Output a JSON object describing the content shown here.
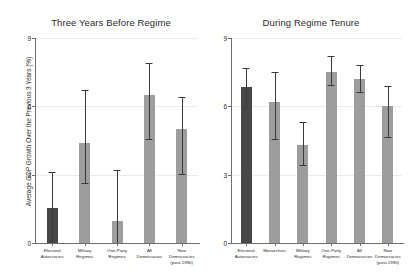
{
  "figure": {
    "ylabel": "Average GDP Growth Over the Previous 3 Years (%)",
    "bar_color": "#9d9d9d",
    "highlight_color": "#474747",
    "axis_color": "#6f6f6f",
    "grid_color": "#ebebeb"
  },
  "chart_data": [
    {
      "type": "bar",
      "title": "Three Years Before Regime",
      "xlabel": "",
      "ylabel": "Average GDP Growth Over the Previous 3 Years (%)",
      "ylim": [
        0,
        9
      ],
      "yticks": [
        0,
        3,
        6,
        9
      ],
      "ytick_labels": [
        "0",
        "3",
        "6",
        "9"
      ],
      "grid": true,
      "legend": "none",
      "categories": [
        "Electoral\nAutocracies",
        "Military\nRegimes",
        "One-Party\nRegimes",
        "All\nDemocracies",
        "New\nDemocracies\n(post-1990)"
      ],
      "values": [
        1.55,
        4.4,
        0.95,
        6.5,
        5.0
      ],
      "ci_low": [
        0.0,
        2.6,
        0.0,
        4.5,
        3.0
      ],
      "ci_high": [
        3.1,
        6.7,
        3.2,
        7.9,
        6.4
      ],
      "highlighted_index": 0
    },
    {
      "type": "bar",
      "title": "During Regime Tenure",
      "xlabel": "",
      "ylabel": "",
      "ylim": [
        0,
        9
      ],
      "yticks": [
        0,
        3,
        6,
        9
      ],
      "ytick_labels": [
        "0",
        "3",
        "6",
        "9"
      ],
      "grid": true,
      "legend": "none",
      "categories": [
        "Electoral\nAutocracies",
        "Monarchies",
        "Military\nRegimes",
        "One-Party\nRegimes",
        "All\nDemocracies",
        "New\nDemocracies\n(post-1990)"
      ],
      "values": [
        6.85,
        6.2,
        4.3,
        7.5,
        7.2,
        6.0
      ],
      "ci_low": [
        5.9,
        4.5,
        3.4,
        6.9,
        6.6,
        4.6
      ],
      "ci_high": [
        7.7,
        7.5,
        5.3,
        8.2,
        7.8,
        6.9
      ],
      "highlighted_index": 0
    }
  ]
}
